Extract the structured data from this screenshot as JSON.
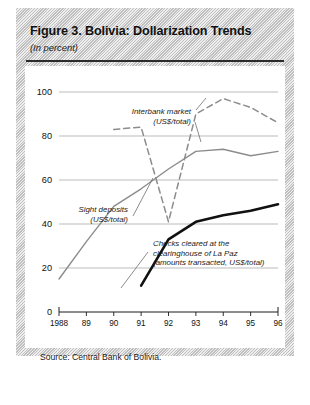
{
  "figure": {
    "title": "Figure 3.  Bolivia: Dollarization Trends",
    "subtitle": "(In percent)",
    "source": "Source: Central Bank of Bolivia."
  },
  "chart_data": {
    "type": "line",
    "title": "Figure 3.  Bolivia: Dollarization Trends",
    "subtitle": "(In percent)",
    "xlabel": "",
    "ylabel": "",
    "xlim": [
      1988,
      1996
    ],
    "ylim": [
      0,
      100
    ],
    "yticks": [
      0,
      20,
      40,
      60,
      80,
      100
    ],
    "ytick_labels": [
      "0",
      "20",
      "40",
      "60",
      "80",
      "100"
    ],
    "x": [
      1988,
      1989,
      1990,
      1991,
      1992,
      1993,
      1994,
      1995,
      1996
    ],
    "xtick_labels": [
      "1988",
      "89",
      "90",
      "91",
      "92",
      "93",
      "94",
      "95",
      "96"
    ],
    "grid": "horizontal",
    "legend": "annotations-inline",
    "series": [
      {
        "name": "Interbank market (US$/total)",
        "style": "dashed",
        "color": "#8c8c8c",
        "x": [
          1990,
          1991,
          1992,
          1993,
          1994,
          1995,
          1996
        ],
        "values": [
          83,
          84,
          41,
          90,
          97,
          93,
          86
        ]
      },
      {
        "name": "Sight deposits (US$/total)",
        "style": "solid",
        "color": "#8c8c8c",
        "x": [
          1988,
          1989,
          1990,
          1991,
          1992,
          1993,
          1994,
          1995,
          1996
        ],
        "values": [
          15,
          32,
          48,
          56,
          65,
          73,
          74,
          71,
          73
        ]
      },
      {
        "name": "Checks cleared at the clearinghouse of La Paz (amounts transacted, US$/total)",
        "style": "solid-thick",
        "color": "#111111",
        "x": [
          1991,
          1992,
          1993,
          1994,
          1995,
          1996
        ],
        "values": [
          12,
          33,
          41,
          44,
          46,
          49
        ]
      }
    ],
    "annotations": [
      {
        "id": "interbank",
        "lines": [
          "Interbank market",
          "(US$/total)"
        ],
        "align": "end"
      },
      {
        "id": "sight-deposits",
        "lines": [
          "Sight deposits",
          "(US$/total)"
        ],
        "align": "end"
      },
      {
        "id": "checks-cleared",
        "lines": [
          "Checks cleared at the",
          "clearinghouse of La Paz",
          "(amounts transacted, US$/total)"
        ],
        "align": "start"
      }
    ]
  },
  "colors": {
    "dashed_series": "#8c8c8c",
    "solid_series": "#8c8c8c",
    "thick_series": "#111111",
    "grid": "#b3b3b3",
    "axis": "#1a1a1a",
    "page_block": "#d9d9d9"
  }
}
